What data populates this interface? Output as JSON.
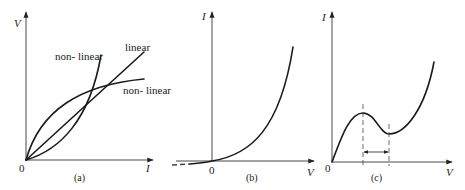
{
  "figure": {
    "panels": [
      {
        "id": "a",
        "caption": "(a)",
        "x_axis_label": "I",
        "y_axis_label": "V",
        "origin_label": "0",
        "curves": [
          {
            "name": "non-linear-steep",
            "label": "non- linear"
          },
          {
            "name": "linear",
            "label": "linear"
          },
          {
            "name": "non-linear-concave",
            "label": "non- linear"
          }
        ]
      },
      {
        "id": "b",
        "caption": "(b)",
        "x_axis_label": "V",
        "y_axis_label": "I",
        "origin_label": "0"
      },
      {
        "id": "c",
        "caption": "(c)",
        "x_axis_label": "V",
        "y_axis_label": "I",
        "origin_label": "0"
      }
    ]
  },
  "colors": {
    "ink": "#1a1a1a",
    "background": "#ffffff"
  }
}
